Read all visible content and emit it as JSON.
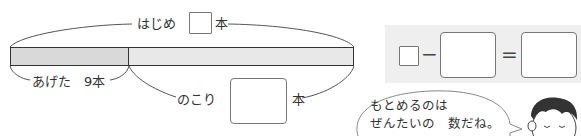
{
  "tape_diagram": {
    "top_label": {
      "text": "はじめ",
      "unit": "本"
    },
    "left_part": {
      "label": "あげた",
      "value": "9本",
      "fill": "#d9d9d9"
    },
    "right_part": {
      "label": "のこり",
      "unit": "本",
      "fill": "#e8e8e8"
    }
  },
  "equation": {
    "panel_color": "#efefef",
    "minus": "−",
    "equals": "="
  },
  "speech_bubble": {
    "line1": "もとめるのは",
    "line2": "ぜんたいの　数だね。"
  }
}
